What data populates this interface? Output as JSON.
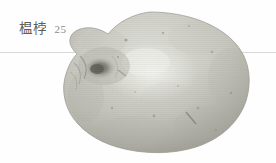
{
  "page": {
    "width": 276,
    "height": 163,
    "background_color": "#fefefe",
    "kind": "scanned-book-plate"
  },
  "caption": {
    "name": "榅桲",
    "number": "25",
    "name_color": "#5d5d5d",
    "number_color": "#8a8a8a"
  },
  "rule": {
    "color": "#d8d8d8",
    "y": 52,
    "thickness": 1
  },
  "illustration": {
    "subject": "quince-fruit",
    "style": "grayscale halftone photograph",
    "body_light": "#dcdcd6",
    "body_mid": "#c3c3bb",
    "body_shadow": "#a9a9a0",
    "body_highlight": "#eeeee9",
    "outline": "#9a9a92",
    "calyx_dark": "#6f6f67",
    "speck_color": "#8e8e84",
    "bounds": {
      "left": 64,
      "top": 11,
      "right": 252,
      "bottom": 153
    }
  }
}
